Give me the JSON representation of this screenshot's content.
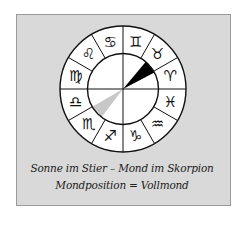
{
  "figure": {
    "caption_line1": "Sonne im Stier – Mond im Skorpion",
    "caption_line2": "Mondposition = Vollmond"
  },
  "wheel": {
    "signs": [
      {
        "name": "gemini",
        "glyph": "♊"
      },
      {
        "name": "taurus",
        "glyph": "♉"
      },
      {
        "name": "aries",
        "glyph": "♈"
      },
      {
        "name": "pisces",
        "glyph": "♓"
      },
      {
        "name": "aquarius",
        "glyph": "♒"
      },
      {
        "name": "capricorn",
        "glyph": "♑"
      },
      {
        "name": "sagittarius",
        "glyph": "♐"
      },
      {
        "name": "scorpio",
        "glyph": "♏"
      },
      {
        "name": "libra",
        "glyph": "♎"
      },
      {
        "name": "virgo",
        "glyph": "♍"
      },
      {
        "name": "leo",
        "glyph": "♌"
      },
      {
        "name": "cancer",
        "glyph": "♋"
      }
    ],
    "sun_sign": "taurus",
    "moon_sign": "scorpio",
    "colors": {
      "sun": "#000000",
      "moon": "#c8c8c8",
      "background": "#d9d9d9"
    }
  }
}
